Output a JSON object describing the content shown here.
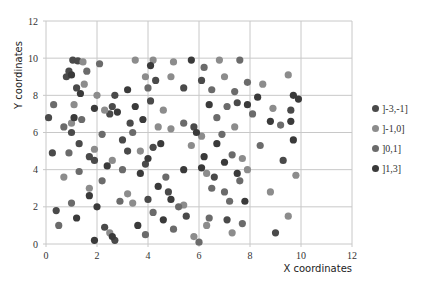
{
  "chart_data": {
    "type": "scatter",
    "title": "",
    "xlabel": "X coordinates",
    "ylabel": "Y coordinates",
    "xlim": [
      0,
      12
    ],
    "ylim": [
      0,
      12
    ],
    "xticks": [
      "0",
      "2",
      "4",
      "6",
      "8",
      "10",
      "12"
    ],
    "yticks": [
      "0",
      "2",
      "4",
      "6",
      "8",
      "10",
      "12"
    ],
    "grid": true,
    "legend_position": "right",
    "series": [
      {
        "name": "]-3,-1]",
        "color": "#4a4a4a",
        "points": [
          [
            1.05,
            9.9
          ],
          [
            1.25,
            9.85
          ],
          [
            0.9,
            9.3
          ],
          [
            0.8,
            9.0
          ],
          [
            1.2,
            8.4
          ],
          [
            0.1,
            6.8
          ],
          [
            0.25,
            4.9
          ],
          [
            0.4,
            1.8
          ],
          [
            1.0,
            6.0
          ],
          [
            1.3,
            5.4
          ],
          [
            1.7,
            4.7
          ],
          [
            1.9,
            4.5
          ],
          [
            2.7,
            8.0
          ],
          [
            2.6,
            7.4
          ],
          [
            2.5,
            7.0
          ],
          [
            3.3,
            6.5
          ],
          [
            3.0,
            5.6
          ],
          [
            3.2,
            5.0
          ],
          [
            3.9,
            4.3
          ],
          [
            4.2,
            5.2
          ],
          [
            4.3,
            8.8
          ],
          [
            4.1,
            7.7
          ],
          [
            5.4,
            8.4
          ],
          [
            4.0,
            2.4
          ],
          [
            4.8,
            2.8
          ],
          [
            5.5,
            1.5
          ],
          [
            6.1,
            8.8
          ],
          [
            5.8,
            6.3
          ],
          [
            7.5,
            7.6
          ],
          [
            6.6,
            3.6
          ],
          [
            7.1,
            1.3
          ],
          [
            9.6,
            7.2
          ],
          [
            9.3,
            4.5
          ],
          [
            9.0,
            0.6
          ],
          [
            2.3,
            0.9
          ],
          [
            2.7,
            0.2
          ]
        ]
      },
      {
        "name": "]-1,0]",
        "color": "#8c8c8c",
        "points": [
          [
            1.45,
            9.8
          ],
          [
            1.5,
            8.6
          ],
          [
            1.1,
            7.5
          ],
          [
            2.0,
            8.0
          ],
          [
            2.3,
            7.2
          ],
          [
            1.0,
            6.5
          ],
          [
            1.9,
            5.1
          ],
          [
            2.6,
            4.5
          ],
          [
            0.7,
            3.6
          ],
          [
            1.7,
            3.0
          ],
          [
            3.5,
            9.9
          ],
          [
            4.2,
            9.9
          ],
          [
            3.9,
            9.0
          ],
          [
            4.6,
            7.2
          ],
          [
            4.4,
            6.3
          ],
          [
            4.9,
            6.2
          ],
          [
            3.7,
            5.0
          ],
          [
            5.0,
            9.8
          ],
          [
            4.9,
            9.0
          ],
          [
            3.2,
            2.7
          ],
          [
            3.4,
            2.2
          ],
          [
            5.4,
            2.1
          ],
          [
            6.1,
            5.8
          ],
          [
            5.7,
            5.3
          ],
          [
            6.3,
            3.8
          ],
          [
            6.8,
            9.9
          ],
          [
            7.0,
            9.0
          ],
          [
            8.5,
            8.6
          ],
          [
            8.9,
            7.3
          ],
          [
            7.4,
            6.3
          ],
          [
            7.7,
            4.6
          ],
          [
            7.9,
            4.0
          ],
          [
            8.8,
            2.8
          ],
          [
            9.5,
            9.1
          ],
          [
            9.8,
            3.7
          ],
          [
            6.3,
            1.0
          ],
          [
            5.8,
            0.4
          ],
          [
            7.3,
            0.6
          ],
          [
            9.5,
            1.5
          ],
          [
            2.5,
            0.6
          ]
        ]
      },
      {
        "name": "]0,1]",
        "color": "#6b6b6b",
        "points": [
          [
            0.3,
            7.5
          ],
          [
            0.7,
            6.3
          ],
          [
            1.6,
            9.3
          ],
          [
            2.1,
            9.7
          ],
          [
            1.4,
            6.7
          ],
          [
            2.2,
            5.9
          ],
          [
            0.9,
            4.9
          ],
          [
            1.3,
            3.9
          ],
          [
            2.2,
            3.4
          ],
          [
            2.9,
            2.3
          ],
          [
            3.4,
            6.0
          ],
          [
            3.0,
            4.0
          ],
          [
            4.0,
            8.4
          ],
          [
            4.7,
            3.6
          ],
          [
            4.2,
            1.7
          ],
          [
            5.2,
            2.0
          ],
          [
            5.4,
            6.5
          ],
          [
            6.5,
            8.3
          ],
          [
            6.2,
            9.5
          ],
          [
            6.7,
            6.8
          ],
          [
            7.1,
            7.4
          ],
          [
            7.6,
            9.9
          ],
          [
            7.9,
            8.7
          ],
          [
            7.4,
            8.2
          ],
          [
            6.9,
            5.9
          ],
          [
            7.3,
            4.8
          ],
          [
            7.6,
            3.4
          ],
          [
            6.5,
            3.0
          ],
          [
            7.2,
            2.3
          ],
          [
            6.4,
            1.4
          ],
          [
            7.7,
            1.1
          ],
          [
            8.1,
            7.0
          ],
          [
            8.4,
            5.3
          ],
          [
            9.2,
            6.4
          ],
          [
            1.0,
            2.2
          ],
          [
            0.5,
            1.0
          ],
          [
            3.9,
            0.5
          ],
          [
            5.0,
            0.8
          ],
          [
            6.0,
            0.1
          ],
          [
            7.0,
            2.8
          ]
        ]
      },
      {
        "name": "]1,3]",
        "color": "#3a3a3a",
        "points": [
          [
            1.0,
            9.1
          ],
          [
            1.35,
            8.1
          ],
          [
            1.1,
            6.8
          ],
          [
            1.9,
            7.3
          ],
          [
            2.8,
            7.1
          ],
          [
            3.5,
            7.4
          ],
          [
            3.8,
            6.7
          ],
          [
            3.2,
            8.3
          ],
          [
            4.5,
            5.4
          ],
          [
            4.0,
            4.6
          ],
          [
            3.7,
            3.8
          ],
          [
            2.4,
            4.2
          ],
          [
            1.7,
            2.6
          ],
          [
            1.2,
            1.4
          ],
          [
            2.0,
            2.0
          ],
          [
            4.4,
            3.1
          ],
          [
            4.6,
            1.3
          ],
          [
            5.9,
            6.0
          ],
          [
            6.1,
            4.1
          ],
          [
            5.4,
            4.0
          ],
          [
            6.2,
            4.7
          ],
          [
            6.7,
            5.4
          ],
          [
            7.0,
            4.4
          ],
          [
            7.9,
            7.5
          ],
          [
            8.3,
            7.9
          ],
          [
            9.7,
            8.0
          ],
          [
            9.9,
            7.8
          ],
          [
            9.6,
            6.6
          ],
          [
            7.8,
            2.3
          ],
          [
            7.5,
            3.8
          ],
          [
            4.1,
            9.6
          ],
          [
            5.7,
            9.9
          ],
          [
            6.4,
            7.5
          ],
          [
            3.6,
            1.0
          ],
          [
            4.9,
            2.4
          ],
          [
            1.9,
            0.2
          ],
          [
            2.6,
            0.4
          ],
          [
            8.8,
            6.6
          ],
          [
            9.7,
            5.6
          ]
        ]
      }
    ]
  },
  "axes": {
    "x_title": "X coordinates",
    "y_title": "Y coordinates"
  },
  "legend": {
    "items": [
      {
        "label": "]-3,-1]",
        "color": "#4a4a4a"
      },
      {
        "label": "]-1,0]",
        "color": "#8c8c8c"
      },
      {
        "label": "]0,1]",
        "color": "#6b6b6b"
      },
      {
        "label": "]1,3]",
        "color": "#3a3a3a"
      }
    ]
  }
}
